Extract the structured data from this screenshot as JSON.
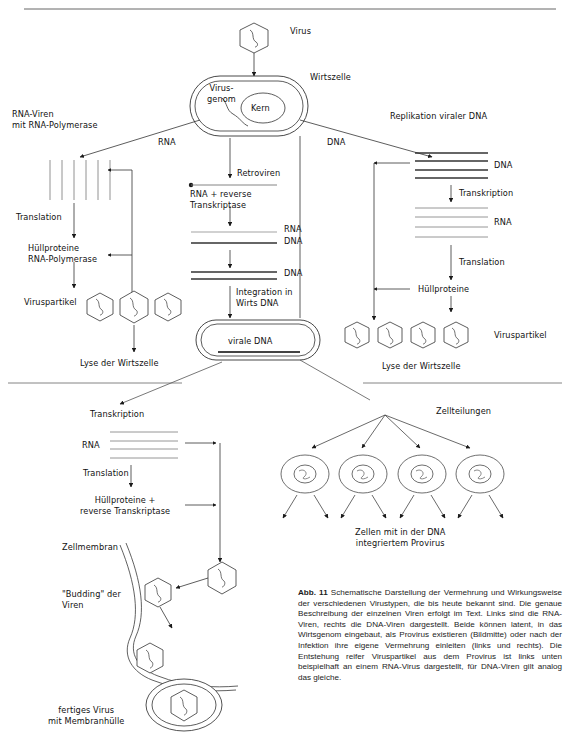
{
  "page": {
    "figure_number": "Abb. 11",
    "caption": "Schematische Darstellung der Vermehrung und Wirkungsweise der verschiedenen Virustypen, die bis heute bekannt sind. Die genaue Beschreibung der einzelnen Viren erfolgt im Text. Links sind die RNA-Viren, rechts die DNA-Viren dargestellt. Beide können latent, in das Wirtsgenom eingebaut, als Provirus existieren (Bildmitte) oder nach der Infektion ihre eigene Vermehrung einleiten (links und rechts). Die Entstehung reifer Viruspartikel aus dem Provirus ist links unten beispielhaft an einem RNA-Virus dargestellt, für DNA-Viren gilt analog das gleiche."
  },
  "diagram": {
    "type": "biological-flow-diagram",
    "labels": {
      "virus": "Virus",
      "host_cell": "Wirtszelle",
      "virus_genome": "Virus-\ngenom",
      "nucleus": "Kern",
      "rna_viruses": "RNA-Viren\nmit RNA-Polymerase",
      "rna_branch": "RNA",
      "dna_branch": "DNA",
      "retroviruses": "Retroviren",
      "dna_replication": "Replikation viraler DNA",
      "translation_left": "Translation",
      "envelope_proteins_left": "Hüllproteine\nRNA-Polymerase",
      "virus_particles_left": "Viruspartikel",
      "lysis_left": "Lyse der Wirtszelle",
      "rna_plus_rt": "RNA + reverse\nTranskriptase",
      "rna_mid": "RNA",
      "dna_mid_1": "DNA",
      "dna_mid_2": "DNA",
      "integration": "Integration in\nWirts DNA",
      "viral_dna": "virale DNA",
      "dna_right": "DNA",
      "transcription_right": "Transkription",
      "rna_right": "RNA",
      "translation_right": "Translation",
      "envelope_proteins_right": "Hüllproteine",
      "virus_particles_right": "Viruspartikel",
      "lysis_right": "Lyse der Wirtszelle",
      "transcription_bottom": "Transkription",
      "rna_bottom": "RNA",
      "translation_bottom": "Translation",
      "envelope_proteins_bottom": "Hüllproteine +\nreverse Transkriptase",
      "cell_divisions": "Zellteilungen",
      "provirus_cells": "Zellen mit in der DNA\nintegriertem Provirus",
      "cell_membrane": "Zellmembran",
      "budding": "\"Budding\" der\nViren",
      "finished_virus": "fertiges Virus\nmit Membranhülle"
    },
    "colors": {
      "ink": "#1a1a1a",
      "line": "#444444",
      "light_line": "#8a8a8a",
      "background": "#ffffff"
    }
  }
}
